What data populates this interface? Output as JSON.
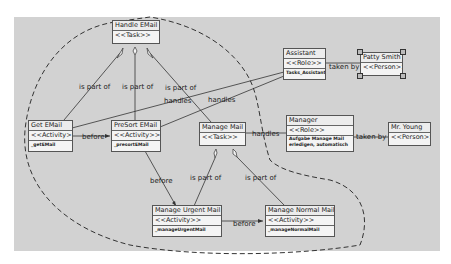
{
  "nodes": {
    "handle_email": {
      "name": "Handle EMail",
      "stereotype": "<<Task>>"
    },
    "get_email": {
      "name": "Get EMail",
      "stereotype": "<<Activity>>",
      "function": "_getEMail"
    },
    "presort_email": {
      "name": "PreSort EMail",
      "stereotype": "<<Activity>>",
      "function": "_presortEMail"
    },
    "manage_mail": {
      "name": "Manage Mail",
      "stereotype": "<<Task>>"
    },
    "manage_urgent": {
      "name": "Manage Urgent Mail",
      "stereotype": "<<Activity>>",
      "function": "_manageUrgentMail"
    },
    "manage_normal": {
      "name": "Manage Normal Mail",
      "stereotype": "<<Activity>>",
      "function": "_manageNormalMail"
    },
    "assistant": {
      "name": "Assistant",
      "stereotype": "<<Role>>",
      "function": "Tasks_Assistant"
    },
    "manager": {
      "name": "Manager",
      "stereotype": "<<Role>>",
      "function": "Aufgabe Manage Mail erledigen, automatisch erstellt"
    },
    "patty_smith": {
      "name": "Patty Smith",
      "stereotype": "<<Person>>"
    },
    "mr_young": {
      "name": "Mr. Young",
      "stereotype": "<<Person>>"
    }
  },
  "edge_labels": {
    "part_of_1": "is part of",
    "part_of_2": "is part of",
    "part_of_3": "is part of",
    "part_of_4": "is part of",
    "part_of_5": "is part of",
    "handles_1": "handles",
    "handles_2": "handles",
    "handles_3": "handles",
    "before_1": "before",
    "before_2": "before",
    "before_3": "before",
    "taken_by_1": "taken by",
    "taken_by_2": "taken by"
  }
}
